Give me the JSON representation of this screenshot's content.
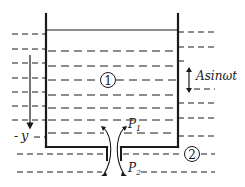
{
  "diagram": {
    "title": "",
    "labels": {
      "region_inside": "1",
      "region_outside": "2",
      "oscillation": "Asinωt",
      "axis": "y",
      "axis_prefix": "-",
      "pressure_top": "P",
      "pressure_top_sub": "1",
      "pressure_bottom": "P",
      "pressure_bottom_sub": "2"
    },
    "colors": {
      "stroke": "#1a1a1a",
      "background": "#ffffff"
    }
  }
}
